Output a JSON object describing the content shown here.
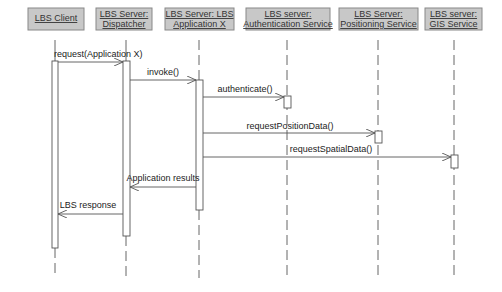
{
  "diagram": {
    "type": "sequence",
    "colors": {
      "header_fill": "#c8c8c8",
      "header_stroke": "#888888",
      "line": "#555555",
      "background": "#ffffff"
    },
    "participants": [
      {
        "id": "client",
        "line1": "LBS Client",
        "line2": "",
        "x": 55,
        "box": [
          28,
          8,
          56,
          22
        ]
      },
      {
        "id": "dispatcher",
        "line1": "LBS Server:",
        "line2": "Dispatcher",
        "x": 126,
        "box": [
          96,
          8,
          56,
          22
        ]
      },
      {
        "id": "appx",
        "line1": "LBS Server: LBS",
        "line2": "Application X",
        "x": 199,
        "box": [
          165,
          8,
          69,
          22
        ]
      },
      {
        "id": "auth",
        "line1": "LBS server:",
        "line2": "Authentication Service",
        "x": 287,
        "box": [
          246,
          8,
          84,
          22
        ]
      },
      {
        "id": "positioning",
        "line1": "LBS Server:",
        "line2": "Positioning Service",
        "x": 378,
        "box": [
          339,
          8,
          79,
          22
        ]
      },
      {
        "id": "gis",
        "line1": "LBS server:",
        "line2": "GIS Service",
        "x": 454,
        "box": [
          425,
          8,
          57,
          22
        ]
      }
    ],
    "messages": [
      {
        "label": "request(Application X)",
        "from": "client",
        "to": "dispatcher",
        "y": 62,
        "type": "call"
      },
      {
        "label": "invoke()",
        "from": "dispatcher",
        "to": "appx",
        "y": 80,
        "type": "call"
      },
      {
        "label": "authenticate()",
        "from": "appx",
        "to": "auth",
        "y": 97,
        "type": "call"
      },
      {
        "label": "requestPositionData()",
        "from": "appx",
        "to": "positioning",
        "y": 133,
        "type": "call"
      },
      {
        "label": "requestSpatialData()",
        "from": "appx",
        "to": "gis",
        "y": 157,
        "type": "call"
      },
      {
        "label": "Application results",
        "from": "appx",
        "to": "dispatcher",
        "y": 187,
        "type": "return"
      },
      {
        "label": "LBS response",
        "from": "dispatcher",
        "to": "client",
        "y": 214,
        "type": "return"
      }
    ]
  }
}
